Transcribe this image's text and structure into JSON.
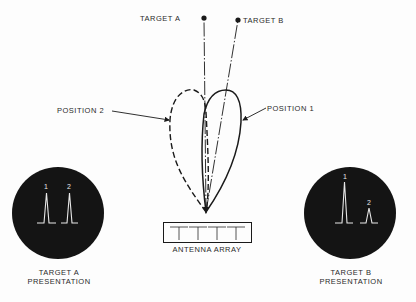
{
  "diagram": {
    "targets": [
      {
        "id": "A",
        "label": "TARGET A"
      },
      {
        "id": "B",
        "label": "TARGET B"
      }
    ],
    "positions": [
      {
        "id": "1",
        "label": "POSITION 1",
        "line_style": "solid"
      },
      {
        "id": "2",
        "label": "POSITION 2",
        "line_style": "dashed"
      }
    ],
    "antenna": {
      "label": "ANTENNA ARRAY",
      "element_count": 4
    },
    "presentations": [
      {
        "id": "A",
        "title_line1": "TARGET A",
        "title_line2": "PRESENTATION",
        "pulses": [
          {
            "label": "1",
            "height": "equal"
          },
          {
            "label": "2",
            "height": "equal"
          }
        ]
      },
      {
        "id": "B",
        "title_line1": "TARGET B",
        "title_line2": "PRESENTATION",
        "pulses": [
          {
            "label": "1",
            "height": "tall"
          },
          {
            "label": "2",
            "height": "short"
          }
        ]
      }
    ],
    "colors": {
      "ink": "#1a1a1a",
      "scope_face": "#141414",
      "trace": "#e8e8e8",
      "background": "#fdfdfd"
    }
  }
}
